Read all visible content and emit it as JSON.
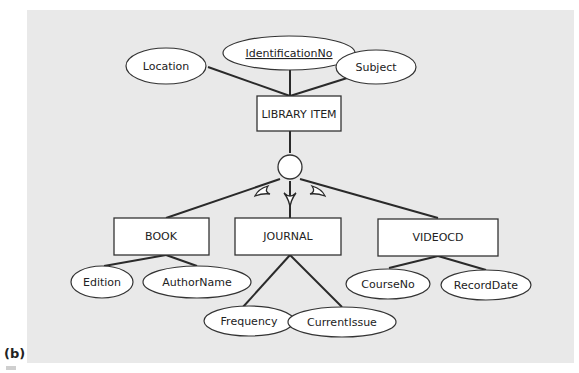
{
  "figure": {
    "panel_label": "(b)",
    "background_color": "#e9e9e9",
    "superclass": {
      "name": "LIBRARY ITEM",
      "attributes": [
        {
          "name": "Location",
          "key": false
        },
        {
          "name": "IdentificationNo",
          "key": true
        },
        {
          "name": "Subject",
          "key": false
        }
      ]
    },
    "specialization": {
      "symbol": "circle",
      "subset_symbols": 3
    },
    "subclasses": [
      {
        "name": "BOOK",
        "attributes": [
          "Edition",
          "AuthorName"
        ]
      },
      {
        "name": "JOURNAL",
        "attributes": [
          "Frequency",
          "CurrentIssue"
        ]
      },
      {
        "name": "VIDEOCD",
        "attributes": [
          "CourseNo",
          "RecordDate"
        ]
      }
    ]
  }
}
